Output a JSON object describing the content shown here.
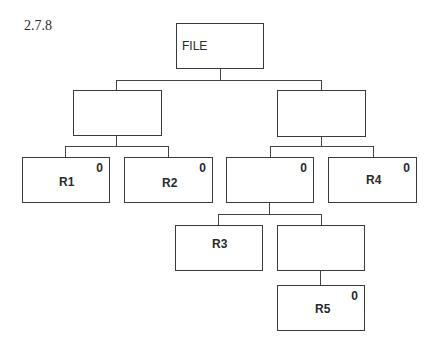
{
  "figure": {
    "caption": "2.7.8"
  },
  "nodes": {
    "file": {
      "label": "FILE",
      "count": null
    },
    "left": {
      "label": "",
      "count": null
    },
    "right": {
      "label": "",
      "count": null
    },
    "r1": {
      "label": "R1",
      "count": "0"
    },
    "r2": {
      "label": "R2",
      "count": "0"
    },
    "inner": {
      "label": "",
      "count": "0"
    },
    "r4": {
      "label": "R4",
      "count": "0"
    },
    "r3": {
      "label": "R3",
      "count": null
    },
    "inner2": {
      "label": "",
      "count": null
    },
    "r5": {
      "label": "R5",
      "count": "0"
    }
  },
  "edges": [
    [
      "file",
      "left"
    ],
    [
      "file",
      "right"
    ],
    [
      "left",
      "r1"
    ],
    [
      "left",
      "r2"
    ],
    [
      "right",
      "inner"
    ],
    [
      "right",
      "r4"
    ],
    [
      "inner",
      "r3"
    ],
    [
      "inner",
      "inner2"
    ],
    [
      "inner2",
      "r5"
    ]
  ]
}
